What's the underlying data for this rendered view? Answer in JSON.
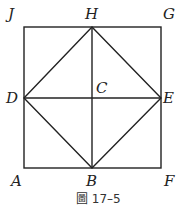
{
  "diagram": {
    "labels": {
      "J": "J",
      "H": "H",
      "G": "G",
      "D": "D",
      "C": "C",
      "E": "E",
      "A": "A",
      "B": "B",
      "F": "F"
    },
    "caption": "圖 17–5",
    "points": {
      "J": [
        24,
        27
      ],
      "H": [
        92,
        27
      ],
      "G": [
        161,
        27
      ],
      "D": [
        24,
        98
      ],
      "C": [
        92,
        98
      ],
      "E": [
        161,
        98
      ],
      "A": [
        24,
        168
      ],
      "B": [
        92,
        168
      ],
      "F": [
        161,
        168
      ]
    },
    "segments": [
      [
        "J",
        "G"
      ],
      [
        "G",
        "F"
      ],
      [
        "F",
        "A"
      ],
      [
        "A",
        "J"
      ],
      [
        "H",
        "E"
      ],
      [
        "E",
        "B"
      ],
      [
        "B",
        "D"
      ],
      [
        "D",
        "H"
      ],
      [
        "H",
        "B"
      ],
      [
        "D",
        "E"
      ]
    ],
    "line_color": "#222222"
  }
}
